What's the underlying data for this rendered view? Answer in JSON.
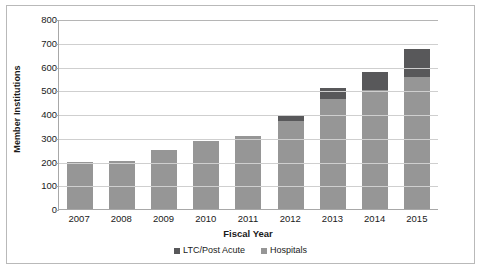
{
  "chart_data": {
    "type": "bar",
    "stacked": true,
    "title": "",
    "xlabel": "Fiscal Year",
    "ylabel": "Member Institutions",
    "ylim": [
      0,
      800
    ],
    "ytick_step": 100,
    "yticks": [
      "800",
      "700",
      "600",
      "500",
      "400",
      "300",
      "200",
      "100",
      "0"
    ],
    "grid": "horizontal",
    "legend_position": "bottom",
    "categories": [
      "2007",
      "2008",
      "2009",
      "2010",
      "2011",
      "2012",
      "2013",
      "2014",
      "2015"
    ],
    "series": [
      {
        "name": "LTC/Post Acute",
        "color": "#58585a",
        "values": [
          0,
          0,
          0,
          0,
          0,
          18,
          47,
          78,
          120
        ]
      },
      {
        "name": "Hospitals",
        "color": "#969696",
        "values": [
          198,
          202,
          248,
          288,
          307,
          372,
          463,
          500,
          555
        ]
      }
    ],
    "totals": [
      198,
      202,
      248,
      288,
      307,
      390,
      510,
      578,
      675
    ]
  }
}
